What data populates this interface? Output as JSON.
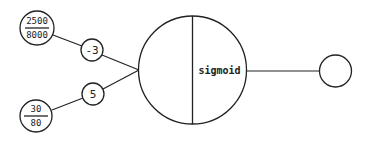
{
  "diagram": {
    "type": "neuron",
    "colors": {
      "stroke": "#222222",
      "background": "#ffffff"
    },
    "inputs": [
      {
        "numerator": "2500",
        "denominator": "8000",
        "weight": "-3"
      },
      {
        "numerator": "30",
        "denominator": "80",
        "weight": "5"
      }
    ],
    "neuron": {
      "activation": "sigmoid"
    },
    "output": {
      "label": ""
    }
  }
}
